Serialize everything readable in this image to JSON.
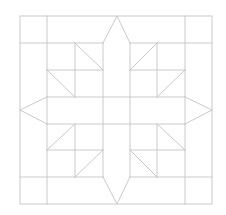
{
  "diagram": {
    "title": "",
    "kind": "quilt-block-star-pattern",
    "background": "#ffffff",
    "stroke_color": "#c4c4c4",
    "stroke_width": 0.9,
    "outer_border": {
      "x": 20,
      "y": 16,
      "w": 192,
      "h": 188
    },
    "grid_x": [
      20,
      47,
      75,
      103,
      130,
      157,
      185,
      212
    ],
    "grid_y": [
      16,
      43,
      70,
      97,
      124,
      150,
      177,
      204
    ],
    "segments": [
      {
        "name": "v-47",
        "x1": 47,
        "y1": 16,
        "x2": 47,
        "y2": 204
      },
      {
        "name": "v-185",
        "x1": 185,
        "y1": 16,
        "x2": 185,
        "y2": 204
      },
      {
        "name": "h-43-left",
        "x1": 20,
        "y1": 43,
        "x2": 103,
        "y2": 43
      },
      {
        "name": "h-43-right",
        "x1": 130,
        "y1": 43,
        "x2": 212,
        "y2": 43
      },
      {
        "name": "h-177-left",
        "x1": 20,
        "y1": 177,
        "x2": 103,
        "y2": 177
      },
      {
        "name": "h-177-right",
        "x1": 130,
        "y1": 177,
        "x2": 212,
        "y2": 177
      },
      {
        "name": "v-103",
        "x1": 103,
        "y1": 43,
        "x2": 103,
        "y2": 177
      },
      {
        "name": "v-130",
        "x1": 130,
        "y1": 43,
        "x2": 130,
        "y2": 177
      },
      {
        "name": "h-97",
        "x1": 47,
        "y1": 97,
        "x2": 185,
        "y2": 97
      },
      {
        "name": "h-124",
        "x1": 47,
        "y1": 124,
        "x2": 185,
        "y2": 124
      },
      {
        "name": "v-75-top",
        "x1": 75,
        "y1": 43,
        "x2": 75,
        "y2": 97
      },
      {
        "name": "v-157-top",
        "x1": 157,
        "y1": 43,
        "x2": 157,
        "y2": 97
      },
      {
        "name": "v-75-bottom",
        "x1": 75,
        "y1": 124,
        "x2": 75,
        "y2": 177
      },
      {
        "name": "v-157-bottom",
        "x1": 157,
        "y1": 124,
        "x2": 157,
        "y2": 177
      },
      {
        "name": "h-70-left",
        "x1": 47,
        "y1": 70,
        "x2": 103,
        "y2": 70
      },
      {
        "name": "h-70-right",
        "x1": 130,
        "y1": 70,
        "x2": 185,
        "y2": 70
      },
      {
        "name": "h-150-left",
        "x1": 47,
        "y1": 150,
        "x2": 103,
        "y2": 150
      },
      {
        "name": "h-150-right",
        "x1": 130,
        "y1": 150,
        "x2": 185,
        "y2": 150
      },
      {
        "name": "diag-tl-1",
        "x1": 75,
        "y1": 43,
        "x2": 103,
        "y2": 70
      },
      {
        "name": "diag-tl-2",
        "x1": 47,
        "y1": 70,
        "x2": 75,
        "y2": 97
      },
      {
        "name": "diag-tr-1",
        "x1": 157,
        "y1": 43,
        "x2": 130,
        "y2": 70
      },
      {
        "name": "diag-tr-2",
        "x1": 185,
        "y1": 70,
        "x2": 157,
        "y2": 97
      },
      {
        "name": "diag-bl-1",
        "x1": 75,
        "y1": 124,
        "x2": 47,
        "y2": 150
      },
      {
        "name": "diag-bl-2",
        "x1": 103,
        "y1": 150,
        "x2": 75,
        "y2": 177
      },
      {
        "name": "diag-br-1",
        "x1": 157,
        "y1": 124,
        "x2": 185,
        "y2": 150
      },
      {
        "name": "diag-br-2",
        "x1": 130,
        "y1": 150,
        "x2": 157,
        "y2": 177
      }
    ],
    "star_arms": [
      {
        "name": "arm-top",
        "points": "103,43 117,16 130,43"
      },
      {
        "name": "arm-right",
        "points": "185,97 212,110 185,124"
      },
      {
        "name": "arm-bottom",
        "points": "103,177 117,204 130,177"
      },
      {
        "name": "arm-left",
        "points": "47,97 20,110 47,124"
      }
    ]
  }
}
